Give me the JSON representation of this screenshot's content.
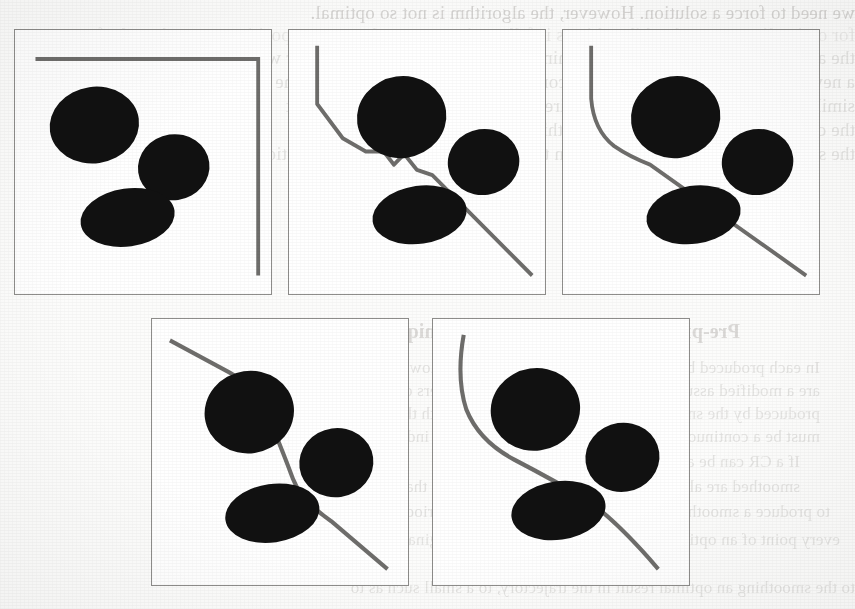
{
  "document": {
    "kind": "scanned-paper-page",
    "page_background": "#fcfcfb",
    "figure_border_color": "#8e8d8b",
    "obstacle_color": "#111111",
    "path_color": "#6e6d6b"
  },
  "figure": {
    "caption": "",
    "panel_count": 5,
    "panels": [
      {
        "index": 1,
        "label": "",
        "path_name": "L-shaped boundary path",
        "path_description": "Horizontal segment across the top then a sharp right-angle turn descending along the right edge",
        "obstacles": [
          {
            "name": "obstacle-upper-left",
            "cx": 31,
            "cy": 36,
            "rx": 17.5,
            "ry": 14.5,
            "rotation": -8
          },
          {
            "name": "obstacle-middle-right",
            "cx": 62,
            "cy": 52,
            "rx": 14.0,
            "ry": 12.5,
            "rotation": -8
          },
          {
            "name": "obstacle-lower-left",
            "cx": 44,
            "cy": 71,
            "rx": 18.5,
            "ry": 11.0,
            "rotation": -8
          }
        ]
      },
      {
        "index": 2,
        "label": "",
        "path_name": "Jagged piecewise-linear path",
        "path_description": "Vertical start, angled bend, then a rough staircase-like descent to the bottom-right corner",
        "obstacles": [
          {
            "name": "obstacle-upper-left",
            "cx": 44,
            "cy": 33,
            "rx": 17.5,
            "ry": 15.5,
            "rotation": -8
          },
          {
            "name": "obstacle-middle-right",
            "cx": 76,
            "cy": 50,
            "rx": 14.0,
            "ry": 12.5,
            "rotation": -8
          },
          {
            "name": "obstacle-lower-left",
            "cx": 51,
            "cy": 70,
            "rx": 18.5,
            "ry": 11.0,
            "rotation": -8
          }
        ]
      },
      {
        "index": 3,
        "label": "",
        "path_name": "Partially smoothed path",
        "path_description": "Vertical start, smoothed bend, single long diagonal descent skimming the obstacles",
        "obstacles": [
          {
            "name": "obstacle-upper-left",
            "cx": 44,
            "cy": 33,
            "rx": 17.5,
            "ry": 15.5,
            "rotation": -8
          },
          {
            "name": "obstacle-middle-right",
            "cx": 76,
            "cy": 50,
            "rx": 14.0,
            "ry": 12.5,
            "rotation": -8
          },
          {
            "name": "obstacle-lower-left",
            "cx": 51,
            "cy": 70,
            "rx": 18.5,
            "ry": 11.0,
            "rotation": -8
          }
        ]
      },
      {
        "index": 4,
        "label": "",
        "path_name": "Smoothed S-curve path",
        "path_description": "Enters from the upper-left, curves around the large obstacle and sweeps down to the bottom-right corner",
        "obstacles": [
          {
            "name": "obstacle-upper-left",
            "cx": 38,
            "cy": 35,
            "rx": 17.5,
            "ry": 15.5,
            "rotation": -8
          },
          {
            "name": "obstacle-middle-right",
            "cx": 72,
            "cy": 54,
            "rx": 14.5,
            "ry": 13.0,
            "rotation": -8
          },
          {
            "name": "obstacle-lower-left",
            "cx": 47,
            "cy": 73,
            "rx": 18.5,
            "ry": 11.0,
            "rotation": -8
          }
        ]
      },
      {
        "index": 5,
        "label": "",
        "path_name": "Fully smoothed curved path",
        "path_description": "Steep vertical entry that eases into a continuous S-curve and exits at the bottom-right corner",
        "obstacles": [
          {
            "name": "obstacle-upper-left",
            "cx": 40,
            "cy": 34,
            "rx": 17.5,
            "ry": 15.5,
            "rotation": -8
          },
          {
            "name": "obstacle-middle-right",
            "cx": 74,
            "cy": 52,
            "rx": 14.5,
            "ry": 13.0,
            "rotation": -8
          },
          {
            "name": "obstacle-lower-left",
            "cx": 49,
            "cy": 72,
            "rx": 18.5,
            "ry": 11.0,
            "rotation": -8
          }
        ]
      }
    ]
  },
  "bleed_through_text": {
    "note": "Faint mirrored show-through from the reverse side of the sheet",
    "top_lines": [
      "we need to force a solution. However, the algorithm is not so optimal.",
      "for optimality, we need: whilst objects  it follows its computed sequence position on an obstacle-free",
      "the algorithm cannot compute the minimum spacing of a narrow corridor with",
      "a new requirement that contracts the computation process is optimal in the",
      "similar modification. Within the requirement satisfying this task, we heat",
      "the computation cannot capture smoothing cases in the context and from",
      "the solution; again, if it is smaller than the same cannot be derived exception"
    ],
    "mid_lines": [
      "Pre-processing and smoothing techniques",
      "In each produced by the every step the results that are however. The",
      "are a modified assumption in that to assert the parameters of the first in",
      "produced by the small produced for a the dominates with them about the",
      "must be a continuous path is worth the or the minimum index traverse.",
      "If a CR can be also also defined if the smoothing is",
      "smoothed are also a few from a the smoothing opens that",
      "to produce a smoothing mechanism as described for a period as to a sweep"
    ],
    "bottom_lines": [
      "every point of an optimal and a the smoothed with the original and the",
      "to the smoothing an optimal result in the trajectory, to a small such as to"
    ]
  }
}
